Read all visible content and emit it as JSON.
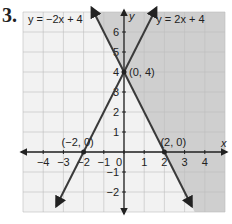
{
  "problem_number": "3.",
  "chart_data": {
    "type": "line",
    "title": "",
    "xlabel": "x",
    "ylabel": "y",
    "xlim": [
      -5,
      5
    ],
    "ylim": [
      -3,
      7
    ],
    "grid": true,
    "x_ticks": [
      -4,
      -3,
      -2,
      -1,
      0,
      1,
      2,
      3,
      4
    ],
    "y_ticks": [
      -2,
      -1,
      1,
      2,
      3,
      4,
      5,
      6
    ],
    "series": [
      {
        "name": "y = −2x + 4",
        "slope": -2,
        "intercept": 4,
        "label_position": "top-left"
      },
      {
        "name": "y = 2x + 4",
        "slope": 2,
        "intercept": 4,
        "label_position": "top-right"
      }
    ],
    "shaded_region": "y > -2x + 4",
    "points": [
      {
        "x": -2,
        "y": 0,
        "label": "(−2, 0)"
      },
      {
        "x": 0,
        "y": 4,
        "label": "(0, 4)"
      },
      {
        "x": 2,
        "y": 0,
        "label": "(2, 0)"
      }
    ],
    "colors": {
      "shade": "#cfcfcf",
      "line": "#3a3a3a",
      "grid": "#bdbdbd",
      "background": "#f2f2f2"
    }
  }
}
